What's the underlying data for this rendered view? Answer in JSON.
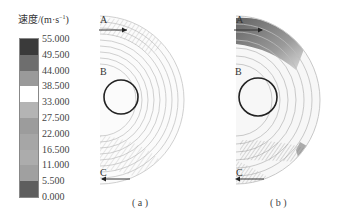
{
  "figure": {
    "legend": {
      "title": "速度/(m·s",
      "title_sup": "−1",
      "title_close": ")",
      "levels": [
        {
          "value": "55.000",
          "color": "#3a3a3a"
        },
        {
          "value": "49.500",
          "color": "#6e6e6e"
        },
        {
          "value": "44.000",
          "color": "#9a9a9a"
        },
        {
          "value": "38.500",
          "color": "#ffffff"
        },
        {
          "value": "33.000",
          "color": "#b4b4b4"
        },
        {
          "value": "27.500",
          "color": "#9c9c9c"
        },
        {
          "value": "22.000",
          "color": "#a6a6a6"
        },
        {
          "value": "16.500",
          "color": "#acacac"
        },
        {
          "value": "11.000",
          "color": "#a0a0a0"
        },
        {
          "value": "5.500",
          "color": "#5e5e5e"
        },
        {
          "value": "0.000",
          "color": "#141414"
        }
      ]
    },
    "panels": [
      {
        "id": "a",
        "caption": "( a )",
        "markers": {
          "A": "A",
          "B": "B",
          "C": "C"
        }
      },
      {
        "id": "b",
        "caption": "( b )",
        "markers": {
          "A": "A",
          "B": "B",
          "C": "C"
        }
      }
    ]
  }
}
